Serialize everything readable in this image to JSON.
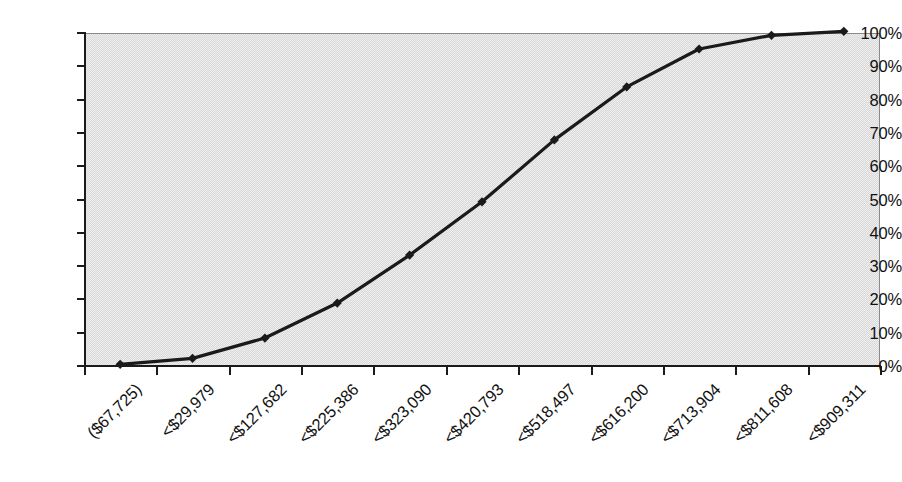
{
  "chart_data": {
    "type": "line",
    "title": "",
    "subtitle": "",
    "xlabel": "",
    "ylabel": "",
    "grid": false,
    "legend": "none",
    "marker": "diamond",
    "line_color": "#1a1a1a",
    "plot_background": "#d9d9d9",
    "plot_border_color": "#8a8a8a",
    "axis_color": "#1a1a1a",
    "ylim": [
      0,
      100
    ],
    "ytick_labels": [
      "0%",
      "10%",
      "20%",
      "30%",
      "40%",
      "50%",
      "60%",
      "70%",
      "80%",
      "90%",
      "100%"
    ],
    "ytick_values": [
      0,
      10,
      20,
      30,
      40,
      50,
      60,
      70,
      80,
      90,
      100
    ],
    "categories": [
      "($67,725)",
      "<$29,979",
      "<$127,682",
      "<$225,386",
      "<$323,090",
      "<$420,793",
      "<$518,497",
      "<$616,200",
      "<$713,904",
      "<$811,608",
      "<$909,311"
    ],
    "series": [
      {
        "name": "Cumulative %",
        "values": [
          0.5,
          2.3,
          8.4,
          18.9,
          33.3,
          49.3,
          67.9,
          83.8,
          95.2,
          99.3,
          100.5
        ]
      }
    ]
  },
  "axes": {
    "y_axis_name": "percent-axis",
    "x_axis_name": "value-bucket-axis"
  }
}
